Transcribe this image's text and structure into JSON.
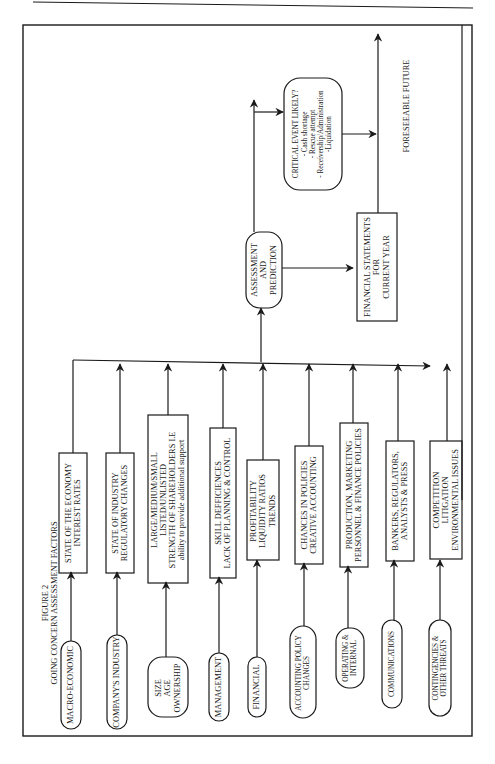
{
  "figure": {
    "number": "FIGURE 2",
    "title": "GOING CONCERN ASSESSMENT FACTORS"
  },
  "sources": [
    {
      "id": "macro",
      "label": [
        "MACRO-ECONOMIC"
      ]
    },
    {
      "id": "industry",
      "label": [
        "COMPANY'S INDUSTRY"
      ]
    },
    {
      "id": "size",
      "label": [
        "SIZE",
        "AGE",
        "OWNERSHIP"
      ]
    },
    {
      "id": "management",
      "label": [
        "MANAGEMENT"
      ]
    },
    {
      "id": "financial",
      "label": [
        "FINANCIAL"
      ]
    },
    {
      "id": "accounting",
      "label": [
        "ACCOUNTING POLICY",
        "CHANGES"
      ]
    },
    {
      "id": "operating",
      "label": [
        "OPERATING &",
        "INTERNAL"
      ]
    },
    {
      "id": "communications",
      "label": [
        "COMMUNICATIONS"
      ]
    },
    {
      "id": "contingencies",
      "label": [
        "CONTINGENCIES &",
        "OTHER THREATS"
      ]
    }
  ],
  "factors": [
    {
      "id": "economy",
      "label": [
        "STATE OF THE ECONOMY",
        "INTEREST RATES"
      ]
    },
    {
      "id": "industry_state",
      "label": [
        "STATE OF INDUSTRY",
        "REGULATORY CHANGES"
      ]
    },
    {
      "id": "size_detail",
      "label": [
        "LARGE/MEDIUM/SMALL",
        "LISTED/UNLISTED",
        "STRENGTH OF SHAREHOLDERS i.e",
        "ability to provide additional support"
      ]
    },
    {
      "id": "skills",
      "label": [
        "SKILL DEFFICIENCES",
        "LACK OF PLANNING & CONTROL"
      ]
    },
    {
      "id": "ratios",
      "label": [
        "PROFITABILITY",
        "LIQUIDITY RATIOS",
        "TRENDS"
      ]
    },
    {
      "id": "policies",
      "label": [
        "CHANCES IN POLICIES",
        "CREATIVE ACCOUNTING"
      ]
    },
    {
      "id": "production",
      "label": [
        "PRODUCTION, MARKETING",
        "PERSONNEL & FINANCE POLICIES"
      ]
    },
    {
      "id": "bankers",
      "label": [
        "BANKERS, REGULATORS,",
        "ANALYSTS & PRESS"
      ]
    },
    {
      "id": "competition",
      "label": [
        "COMPETITION",
        "LITIGATION",
        "ENVIRONMENTAL ISSUES"
      ]
    }
  ],
  "assessment": {
    "label": [
      "ASSESSMENT",
      "AND",
      "PREDICTION"
    ]
  },
  "financial_statements": {
    "label": [
      "FINANCIAL STATEMENTS",
      "FOR",
      "CURRENT YEAR"
    ]
  },
  "critical_event": {
    "title": "CRITICAL EVENT LIKELY?",
    "items": [
      "- Cash shortage",
      "- Rescue attempt",
      "- Receivership/Administration",
      "-Liquidation"
    ]
  },
  "foreseeable_future": "FORESEEABLE FUTURE",
  "colors": {
    "line": "#1a1a1a",
    "background": "#ffffff"
  }
}
